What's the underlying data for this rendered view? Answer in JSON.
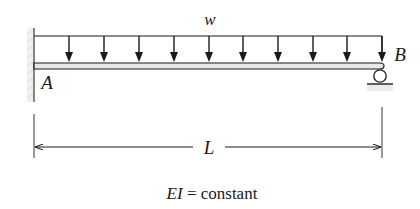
{
  "diagram": {
    "type": "beam-loading",
    "load": {
      "label": "w",
      "kind": "uniformly-distributed",
      "arrow_count": 10
    },
    "supports": [
      {
        "label": "A",
        "kind": "fixed"
      },
      {
        "label": "B",
        "kind": "roller"
      }
    ],
    "dimension": {
      "label": "L"
    },
    "note": {
      "italic_part": "EI",
      "rest": " = constant"
    }
  },
  "colors": {
    "ink": "#1a1a1a",
    "beam_fill": "#e8e8e8",
    "hatch": "#cfcfcf"
  }
}
